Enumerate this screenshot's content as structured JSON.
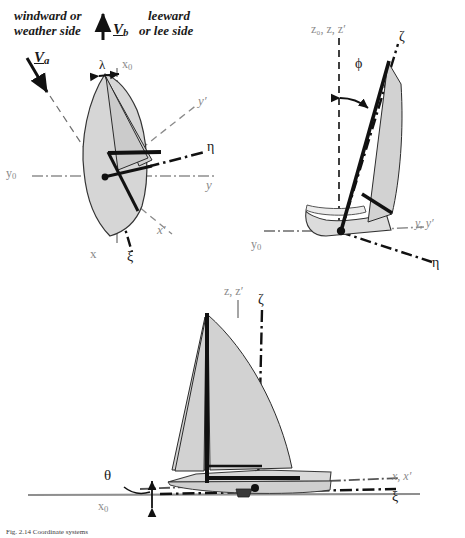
{
  "figure": {
    "caption": "Fig. 2.14 Coordinate systems"
  },
  "colors": {
    "sail_fill": "#d2d2d2",
    "hull_fill": "#d8d8d8",
    "outline": "#2b2b2b",
    "heavy": "#111111",
    "axis_grey": "#8a8a8a",
    "text_grey": "#8a8a8a",
    "text_black": "#1a1a1a",
    "background": "#ffffff"
  },
  "views": {
    "plan": {
      "name": "plan-view-top-left",
      "annotations": {
        "windward": "windward or\nweather side",
        "windward_line1": "windward or",
        "windward_line2": "weather side",
        "leeward_line1": "leeward",
        "leeward_line2": "or lee side",
        "boat_speed_vector": "V",
        "boat_speed_sub": "b",
        "apparent_wind_vector": "V",
        "apparent_wind_sub": "a",
        "leeway_angle": "λ"
      },
      "axes": [
        {
          "label": "x",
          "sub": "0",
          "style": "dash-dot",
          "color": "grey"
        },
        {
          "label": "x",
          "sub": "",
          "style": "solid",
          "color": "grey"
        },
        {
          "label": "x",
          "sub": "",
          "prime": true,
          "style": "dashed",
          "color": "grey"
        },
        {
          "label": "ξ",
          "sub": "",
          "style": "dash-dot",
          "color": "black"
        },
        {
          "label": "y",
          "sub": "0",
          "style": "dash-dot",
          "color": "grey"
        },
        {
          "label": "y",
          "sub": "",
          "style": "dash-dot",
          "color": "grey"
        },
        {
          "label": "y",
          "sub": "",
          "prime": true,
          "style": "dashed",
          "color": "grey"
        },
        {
          "label": "η",
          "sub": "",
          "style": "dash-dot",
          "color": "black"
        }
      ]
    },
    "stern": {
      "name": "stern-view-top-right",
      "annotations": {
        "heel_angle": "ϕ"
      },
      "axes": [
        {
          "label": "z₀, z, z′",
          "style": "dashed",
          "color": "grey"
        },
        {
          "label": "ζ",
          "style": "dash-dot",
          "color": "black"
        },
        {
          "label": "y₀",
          "style": "dash-dot",
          "color": "grey"
        },
        {
          "label": "y, y′",
          "style": "dashed",
          "color": "grey"
        },
        {
          "label": "η",
          "style": "dash-dot",
          "color": "black"
        }
      ]
    },
    "side": {
      "name": "side-view-bottom",
      "annotations": {
        "trim_angle": "θ"
      },
      "axes": [
        {
          "label": "z, z′",
          "style": "solid",
          "color": "grey"
        },
        {
          "label": "ζ",
          "style": "dash-dot",
          "color": "black"
        },
        {
          "label": "x₀",
          "style": "solid",
          "color": "grey"
        },
        {
          "label": "x, x′",
          "style": "dash-dot",
          "color": "grey"
        },
        {
          "label": "ξ",
          "style": "dash-dot",
          "color": "black"
        }
      ]
    }
  },
  "labels": {
    "windward1": "windward or",
    "windward2": "weather side",
    "leeward1": "leeward",
    "leeward2": "or lee side",
    "Vb_main": "V",
    "Vb_sub": "b",
    "Va_main": "V",
    "Va_sub": "a",
    "lambda": "λ",
    "x0_plan": "x",
    "x0_plan_sub": "0",
    "y0_plan": "y",
    "y0_plan_sub": "0",
    "y_plan": "y",
    "yprime_plan": "y′",
    "eta_plan": "η",
    "x_plan": "x",
    "xprime_plan": "x′",
    "xi_plan": "ξ",
    "z_stern": "z₀, z, z′",
    "zeta_stern": "ζ",
    "phi": "ϕ",
    "y0_stern": "y",
    "y0_stern_sub": "0",
    "yy_stern": "y, y′",
    "eta_stern": "η",
    "z_side": "z, z′",
    "zeta_side": "ζ",
    "theta": "θ",
    "x0_side": "x",
    "x0_side_sub": "0",
    "xx_side": "x, x′",
    "xi_side": "ξ",
    "caption": "Fig. 2.14 Coordinate systems"
  }
}
